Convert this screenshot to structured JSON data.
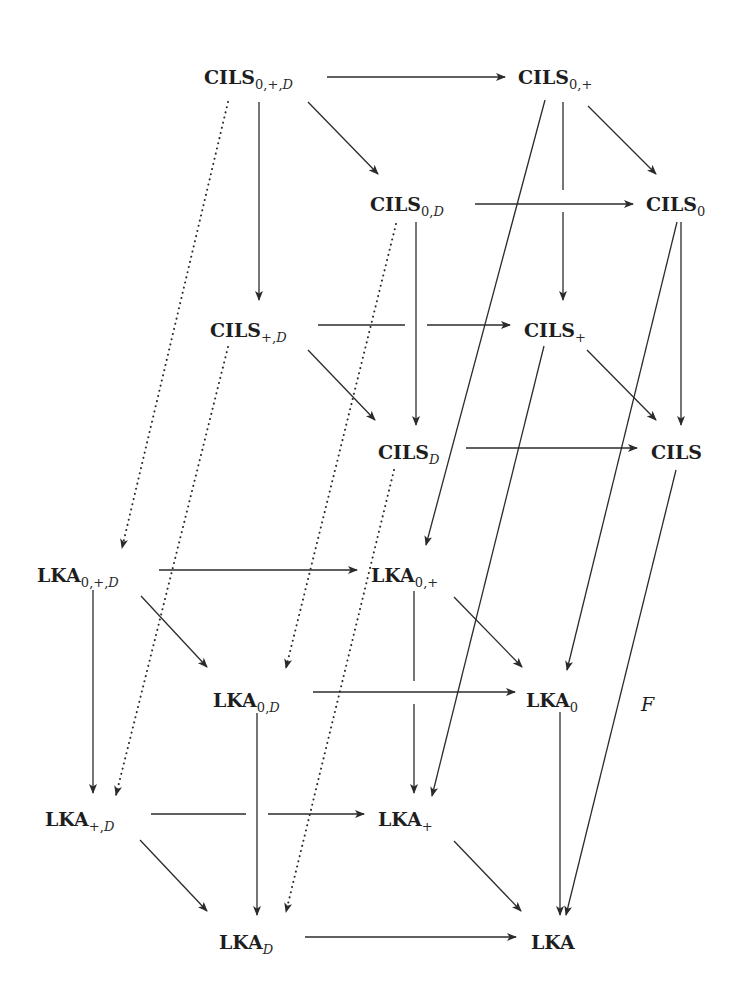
{
  "diagram": {
    "type": "commutative-cube-diagram",
    "nodes": [
      {
        "id": "CILS_0+D",
        "base": "CILS",
        "sub": "0,+,",
        "sub_it": "D",
        "x": 204,
        "y": 77
      },
      {
        "id": "CILS_0+",
        "base": "CILS",
        "sub": "0,+",
        "sub_it": "",
        "x": 518,
        "y": 77
      },
      {
        "id": "CILS_0D",
        "base": "CILS",
        "sub": "0,",
        "sub_it": "D",
        "x": 370,
        "y": 204
      },
      {
        "id": "CILS_0",
        "base": "CILS",
        "sub": "0",
        "sub_it": "",
        "x": 646,
        "y": 204
      },
      {
        "id": "CILS_+D",
        "base": "CILS",
        "sub": "+,",
        "sub_it": "D",
        "x": 210,
        "y": 330
      },
      {
        "id": "CILS_+",
        "base": "CILS",
        "sub": "+",
        "sub_it": "",
        "x": 524,
        "y": 330
      },
      {
        "id": "CILS_D",
        "base": "CILS",
        "sub": "",
        "sub_it": "D",
        "x": 378,
        "y": 452
      },
      {
        "id": "CILS",
        "base": "CILS",
        "sub": "",
        "sub_it": "",
        "x": 651,
        "y": 452
      },
      {
        "id": "LKA_0+D",
        "base": "LKA",
        "sub": "0,+,",
        "sub_it": "D",
        "x": 37,
        "y": 575
      },
      {
        "id": "LKA_0+",
        "base": "LKA",
        "sub": "0,+",
        "sub_it": "",
        "x": 371,
        "y": 575
      },
      {
        "id": "LKA_0D",
        "base": "LKA",
        "sub": "0,",
        "sub_it": "D",
        "x": 213,
        "y": 700
      },
      {
        "id": "LKA_0",
        "base": "LKA",
        "sub": "0",
        "sub_it": "",
        "x": 526,
        "y": 700
      },
      {
        "id": "LKA_+D",
        "base": "LKA",
        "sub": "+,",
        "sub_it": "D",
        "x": 45,
        "y": 819
      },
      {
        "id": "LKA_+",
        "base": "LKA",
        "sub": "+",
        "sub_it": "",
        "x": 378,
        "y": 819
      },
      {
        "id": "LKA_D",
        "base": "LKA",
        "sub": "",
        "sub_it": "D",
        "x": 219,
        "y": 942
      },
      {
        "id": "LKA",
        "base": "LKA",
        "sub": "",
        "sub_it": "",
        "x": 531,
        "y": 942
      }
    ],
    "edges": [
      {
        "from": "CILS_0+D",
        "to": "CILS_0+",
        "style": "solid",
        "pts": [
          [
            327,
            77
          ],
          [
            505,
            77
          ]
        ]
      },
      {
        "from": "CILS_0+D",
        "to": "CILS_0D",
        "style": "solid",
        "pts": [
          [
            308,
            102
          ],
          [
            378,
            174
          ]
        ]
      },
      {
        "from": "CILS_0+D",
        "to": "CILS_+D",
        "style": "solid",
        "pts": [
          [
            259,
            102
          ],
          [
            259,
            300
          ]
        ]
      },
      {
        "from": "CILS_0+D",
        "to": "LKA_0+D",
        "style": "dotted",
        "pts": [
          [
            228,
            102
          ],
          [
            122,
            548
          ]
        ]
      },
      {
        "from": "CILS_0+",
        "to": "CILS_0",
        "style": "solid",
        "pts": [
          [
            588,
            106
          ],
          [
            656,
            174
          ]
        ]
      },
      {
        "from": "CILS_0+",
        "to": "CILS_+",
        "style": "solid",
        "pts": [
          [
            563,
            102
          ],
          [
            563,
            190
          ],
          [
            563,
            212
          ],
          [
            563,
            300
          ]
        ]
      },
      {
        "from": "CILS_0+",
        "to": "LKA_0+",
        "style": "solid",
        "pts": [
          [
            545,
            100
          ],
          [
            426,
            545
          ]
        ]
      },
      {
        "from": "CILS_0D",
        "to": "CILS_0",
        "style": "solid",
        "pts": [
          [
            475,
            204
          ],
          [
            633,
            204
          ]
        ]
      },
      {
        "from": "CILS_0D",
        "to": "CILS_D",
        "style": "solid",
        "pts": [
          [
            416,
            222
          ],
          [
            416,
            425
          ]
        ]
      },
      {
        "from": "CILS_0D",
        "to": "LKA_0D",
        "style": "dotted",
        "pts": [
          [
            396,
            224
          ],
          [
            286,
            668
          ]
        ]
      },
      {
        "from": "CILS_0",
        "to": "CILS",
        "style": "solid",
        "pts": [
          [
            681,
            222
          ],
          [
            681,
            425
          ]
        ]
      },
      {
        "from": "CILS_0",
        "to": "LKA_0",
        "style": "solid",
        "pts": [
          [
            677,
            222
          ],
          [
            567,
            670
          ]
        ]
      },
      {
        "from": "CILS_+D",
        "to": "CILS_+",
        "style": "solid",
        "pts": [
          [
            318,
            325
          ],
          [
            405,
            325
          ],
          [
            427,
            325
          ],
          [
            510,
            325
          ]
        ]
      },
      {
        "from": "CILS_+D",
        "to": "CILS_D",
        "style": "solid",
        "pts": [
          [
            308,
            350
          ],
          [
            375,
            420
          ]
        ]
      },
      {
        "from": "CILS_+D",
        "to": "LKA_+D",
        "style": "dotted",
        "pts": [
          [
            228,
            347
          ],
          [
            116,
            795
          ]
        ]
      },
      {
        "from": "CILS_+",
        "to": "CILS",
        "style": "solid",
        "pts": [
          [
            587,
            350
          ],
          [
            656,
            420
          ]
        ]
      },
      {
        "from": "CILS_+",
        "to": "LKA_+",
        "style": "solid",
        "pts": [
          [
            544,
            346
          ],
          [
            432,
            796
          ]
        ]
      },
      {
        "from": "CILS_D",
        "to": "CILS",
        "style": "solid",
        "pts": [
          [
            466,
            448
          ],
          [
            637,
            448
          ]
        ]
      },
      {
        "from": "CILS_D",
        "to": "LKA_D",
        "style": "dotted",
        "pts": [
          [
            394,
            470
          ],
          [
            286,
            912
          ]
        ]
      },
      {
        "from": "CILS",
        "to": "LKA",
        "style": "solid",
        "pts": [
          [
            676,
            470
          ],
          [
            566,
            915
          ]
        ],
        "label": "F"
      },
      {
        "from": "LKA_0+D",
        "to": "LKA_0+",
        "style": "solid",
        "pts": [
          [
            159,
            570
          ],
          [
            357,
            570
          ]
        ]
      },
      {
        "from": "LKA_0+D",
        "to": "LKA_0D",
        "style": "solid",
        "pts": [
          [
            141,
            596
          ],
          [
            207,
            667
          ]
        ]
      },
      {
        "from": "LKA_0+D",
        "to": "LKA_+D",
        "style": "solid",
        "pts": [
          [
            93,
            590
          ],
          [
            93,
            793
          ]
        ]
      },
      {
        "from": "LKA_0+",
        "to": "LKA_0",
        "style": "solid",
        "pts": [
          [
            454,
            597
          ],
          [
            522,
            667
          ]
        ]
      },
      {
        "from": "LKA_0+",
        "to": "LKA_+",
        "style": "solid",
        "pts": [
          [
            414,
            591
          ],
          [
            414,
            681
          ],
          [
            414,
            704
          ],
          [
            414,
            793
          ]
        ]
      },
      {
        "from": "LKA_0D",
        "to": "LKA_0",
        "style": "solid",
        "pts": [
          [
            313,
            692
          ],
          [
            515,
            692
          ]
        ]
      },
      {
        "from": "LKA_0D",
        "to": "LKA_D",
        "style": "solid",
        "pts": [
          [
            257,
            713
          ],
          [
            257,
            915
          ]
        ]
      },
      {
        "from": "LKA_0",
        "to": "LKA",
        "style": "solid",
        "pts": [
          [
            560,
            712
          ],
          [
            560,
            915
          ]
        ]
      },
      {
        "from": "LKA_+D",
        "to": "LKA_+",
        "style": "solid",
        "pts": [
          [
            151,
            814
          ],
          [
            246,
            814
          ],
          [
            268,
            814
          ],
          [
            364,
            814
          ]
        ]
      },
      {
        "from": "LKA_+D",
        "to": "LKA_D",
        "style": "solid",
        "pts": [
          [
            140,
            840
          ],
          [
            207,
            911
          ]
        ]
      },
      {
        "from": "LKA_+",
        "to": "LKA",
        "style": "solid",
        "pts": [
          [
            454,
            841
          ],
          [
            521,
            911
          ]
        ]
      },
      {
        "from": "LKA_D",
        "to": "LKA",
        "style": "solid",
        "pts": [
          [
            305,
            937
          ],
          [
            516,
            937
          ]
        ]
      }
    ],
    "labels": {
      "functor": "F"
    }
  }
}
